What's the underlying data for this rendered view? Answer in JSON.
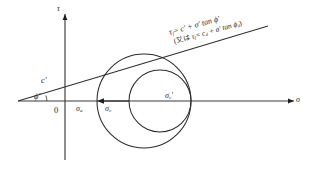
{
  "figure": {
    "kind": "mohr-coulomb-failure-envelope",
    "background_color": "#ffffff",
    "line_color": "#2b2b2b",
    "width": 316,
    "height": 176
  },
  "axes": {
    "vertical_label": "τ",
    "horizontal_label": "σ",
    "origin_label": "0",
    "horizontal_axis": {
      "x_start": 18,
      "x_end": 294,
      "y": 101
    },
    "vertical_axis": {
      "x": 65,
      "y_top": 14,
      "y_bottom": 160
    }
  },
  "envelope": {
    "intercept_label": "c'",
    "angle_label": "ϕ'",
    "angle_degrees": 15.5,
    "line_start": {
      "x": 18,
      "y": 101
    },
    "line_end": {
      "x": 268,
      "y": 26
    }
  },
  "equations": {
    "primary": {
      "lhs": "τ",
      "lhs_sub": "f",
      "rhs_prefix": "= c' + σ' tan ϕ'"
    },
    "secondary": {
      "open_paren": "(",
      "ko_or": "又は",
      "lhs": "τ",
      "lhs_sub": "f",
      "rhs": "= c",
      "rhs_sub": "d",
      "rhs_tail": " + σ' tan ϕ",
      "rhs_tail_sub": "d",
      "close_paren": ")"
    },
    "primary_plain": "τf = c' + σ' tan ϕ'",
    "secondary_plain": "(또는 τf = cd + σ' tan ϕd)"
  },
  "circles": {
    "outer": {
      "name": "outer-mohr-circle",
      "center_x": 144,
      "center_y": 101,
      "radius": 47
    },
    "inner": {
      "name": "inner-mohr-circle",
      "center_x": 160,
      "center_y": 101,
      "radius": 31
    }
  },
  "stress_points": {
    "left_outer": {
      "label_base": "σ",
      "label_sub": "a",
      "x": 97,
      "y": 101
    },
    "left_inner": {
      "label_base": "σ",
      "label_sub": "c",
      "x": 129,
      "y": 101
    },
    "right_shared": {
      "label_base": "σ",
      "label_sub": "c",
      "prime": "'",
      "x": 191,
      "y": 101
    }
  },
  "arrow": {
    "name": "stress-shift-arrow",
    "from_x": 129,
    "to_x": 99,
    "y": 101,
    "direction": "left"
  }
}
